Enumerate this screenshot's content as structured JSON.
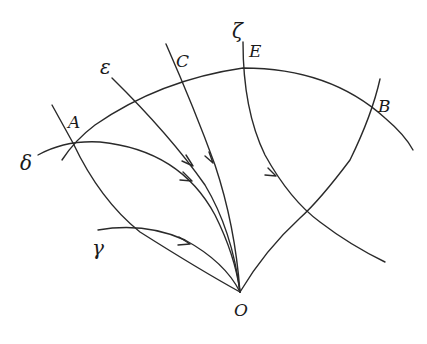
{
  "figure": {
    "point_labels": {
      "A": "A",
      "B": "B",
      "C": "C",
      "E": "E",
      "O": "O"
    },
    "curve_labels": {
      "delta": "δ",
      "epsilon": "ε",
      "zeta": "ζ",
      "gamma": "γ"
    }
  }
}
